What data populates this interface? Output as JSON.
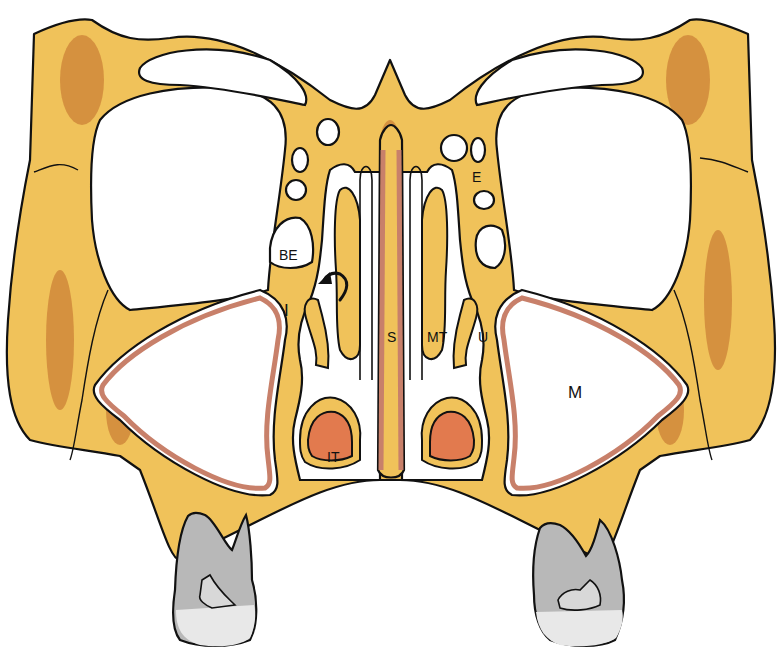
{
  "figure": {
    "colors": {
      "bone": "#f0c25a",
      "bone_shadow": "#e2a040",
      "marrow": "#c06a2a",
      "mucosa": "#c8806a",
      "inferior_turbinate": "#e27a4e",
      "tooth": "#b8b8b8",
      "outline": "#111111",
      "background": "#ffffff"
    },
    "labels": {
      "be": "BE",
      "i": "I",
      "s": "S",
      "mt": "MT",
      "u": "U",
      "it": "IT",
      "e": "E",
      "m": "M"
    }
  }
}
